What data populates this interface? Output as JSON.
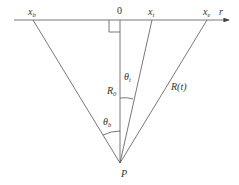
{
  "diagram": {
    "axis": {
      "label": "r",
      "origin_label": "0"
    },
    "points": [
      {
        "id": "xb",
        "base": "x",
        "sub": "b"
      },
      {
        "id": "xt",
        "base": "x",
        "sub": "t"
      },
      {
        "id": "xe",
        "base": "x",
        "sub": "e"
      }
    ],
    "apex_label": "P",
    "angle_labels": {
      "theta_t": {
        "base": "θ",
        "sub": "t"
      },
      "theta_b": {
        "base": "θ",
        "sub": "b"
      }
    },
    "segment_labels": {
      "R0": {
        "base": "R",
        "sub": "0"
      },
      "Rt": "R(t)"
    }
  }
}
